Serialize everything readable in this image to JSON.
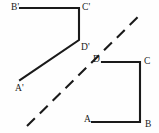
{
  "figure": {
    "background_color": "#fefefe",
    "stroke_color": "#1a1a1a",
    "stroke_width": 2.1,
    "width": 159,
    "height": 133,
    "mirror_line": {
      "name": "line-of-reflection",
      "style": "dashed",
      "dash_pattern": "11 7",
      "x1": 27,
      "y1": 126,
      "x2": 142,
      "y2": 13
    },
    "shapes": [
      {
        "name": "image-trapezoid",
        "id": "trapezoid-prime",
        "label": "A'B'C'D'",
        "points": "20,8 79,8 79,40 20,80",
        "vertices": [
          {
            "key": "A'",
            "x": 20,
            "y": 80
          },
          {
            "key": "B'",
            "x": 20,
            "y": 8
          },
          {
            "key": "C'",
            "x": 79,
            "y": 8
          },
          {
            "key": "D'",
            "x": 79,
            "y": 40
          }
        ]
      },
      {
        "name": "preimage-trapezoid",
        "id": "trapezoid-original",
        "label": "ABCD",
        "points": "92,122 140,122 140,62 102,62",
        "vertices": [
          {
            "key": "A",
            "x": 92,
            "y": 122
          },
          {
            "key": "B",
            "x": 140,
            "y": 122
          },
          {
            "key": "C",
            "x": 140,
            "y": 62
          },
          {
            "key": "D",
            "x": 102,
            "y": 62
          }
        ]
      }
    ],
    "labels": [
      {
        "name": "vertex-label-b-prime",
        "text": "B'",
        "x": 11,
        "y": 3
      },
      {
        "name": "vertex-label-c-prime",
        "text": "C'",
        "x": 82,
        "y": 3
      },
      {
        "name": "vertex-label-d-prime",
        "text": "D'",
        "x": 81,
        "y": 43
      },
      {
        "name": "vertex-label-a-prime",
        "text": "A'",
        "x": 15,
        "y": 84
      },
      {
        "name": "vertex-label-d",
        "text": "D",
        "x": 93,
        "y": 55
      },
      {
        "name": "vertex-label-c",
        "text": "C",
        "x": 144,
        "y": 57
      },
      {
        "name": "vertex-label-a",
        "text": "A",
        "x": 84,
        "y": 115
      },
      {
        "name": "vertex-label-b",
        "text": "B",
        "x": 145,
        "y": 120
      }
    ]
  }
}
